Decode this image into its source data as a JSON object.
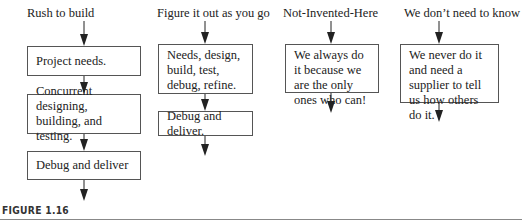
{
  "columns": [
    {
      "title": "Rush to build",
      "steps": [
        "Project needs.",
        "Concurrent designing, building, and testing.",
        "Debug and deliver"
      ]
    },
    {
      "title": "Figure it out as you go",
      "steps": [
        "Needs, design, build, test, debug, refine.",
        "Debug and deliver."
      ]
    },
    {
      "title": "Not-Invented-Here",
      "steps": [
        "We always do it because we are the only ones who can!"
      ]
    },
    {
      "title": "We don’t need to know",
      "steps": [
        "We never do it and need a supplier to tell us how others do it."
      ]
    }
  ],
  "caption": "FIGURE 1.16"
}
